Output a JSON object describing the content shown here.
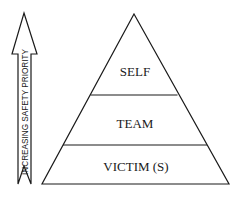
{
  "diagram": {
    "type": "pyramid-with-priority-arrow",
    "arrow": {
      "label": "INCREASING SAFETY PRIORITY",
      "direction": "up"
    },
    "pyramid": {
      "levels": [
        {
          "label": "SELF",
          "position": "top"
        },
        {
          "label": "TEAM",
          "position": "middle"
        },
        {
          "label": "VICTIM (S)",
          "position": "bottom"
        }
      ]
    },
    "colors": {
      "stroke": "#1a1a1a",
      "background": "#ffffff"
    }
  }
}
